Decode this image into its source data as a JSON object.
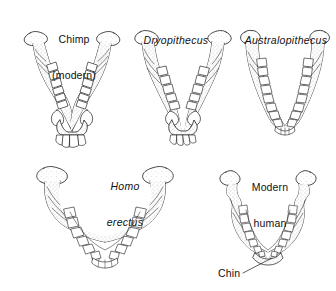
{
  "figure": {
    "kind": "scientific-illustration",
    "background_color": "#ffffff",
    "ink_color": "#1a1a1a",
    "shading_color": "#9a9a9a",
    "rows": 2,
    "specimen_count": 5
  },
  "specimens": [
    {
      "id": "chimp",
      "label_line1": "Chimp",
      "label_line2": "(modern)",
      "italic": false,
      "row": 1,
      "arch_shape": "narrow V with straight parallel tooth rows",
      "notable": "large projecting canines, no chin"
    },
    {
      "id": "dryopithecus",
      "label_line1": "Dryopithecus",
      "label_line2": "",
      "italic": true,
      "row": 1,
      "arch_shape": "narrow V with straight parallel tooth rows",
      "notable": "large canines, no chin"
    },
    {
      "id": "australopithecus",
      "label_line1": "Australopithecus",
      "label_line2": "",
      "italic": true,
      "row": 1,
      "arch_shape": "broad U, slightly rounded front",
      "notable": "reduced canines, robust body, no chin"
    },
    {
      "id": "homo-erectus",
      "label_line1": "Homo",
      "label_line2": "erectus",
      "italic": true,
      "row": 2,
      "arch_shape": "wide parabolic arcade",
      "notable": "rounded dental arcade, receding front, no true chin"
    },
    {
      "id": "modern-human",
      "label_line1": "Modern",
      "label_line2": "human",
      "italic": false,
      "row": 2,
      "arch_shape": "parabolic arcade",
      "notable": "small teeth, projecting bony chin"
    }
  ],
  "annotations": [
    {
      "id": "chin",
      "text": "Chin",
      "points_to": "modern-human front of mandible",
      "leader_line": true
    }
  ]
}
